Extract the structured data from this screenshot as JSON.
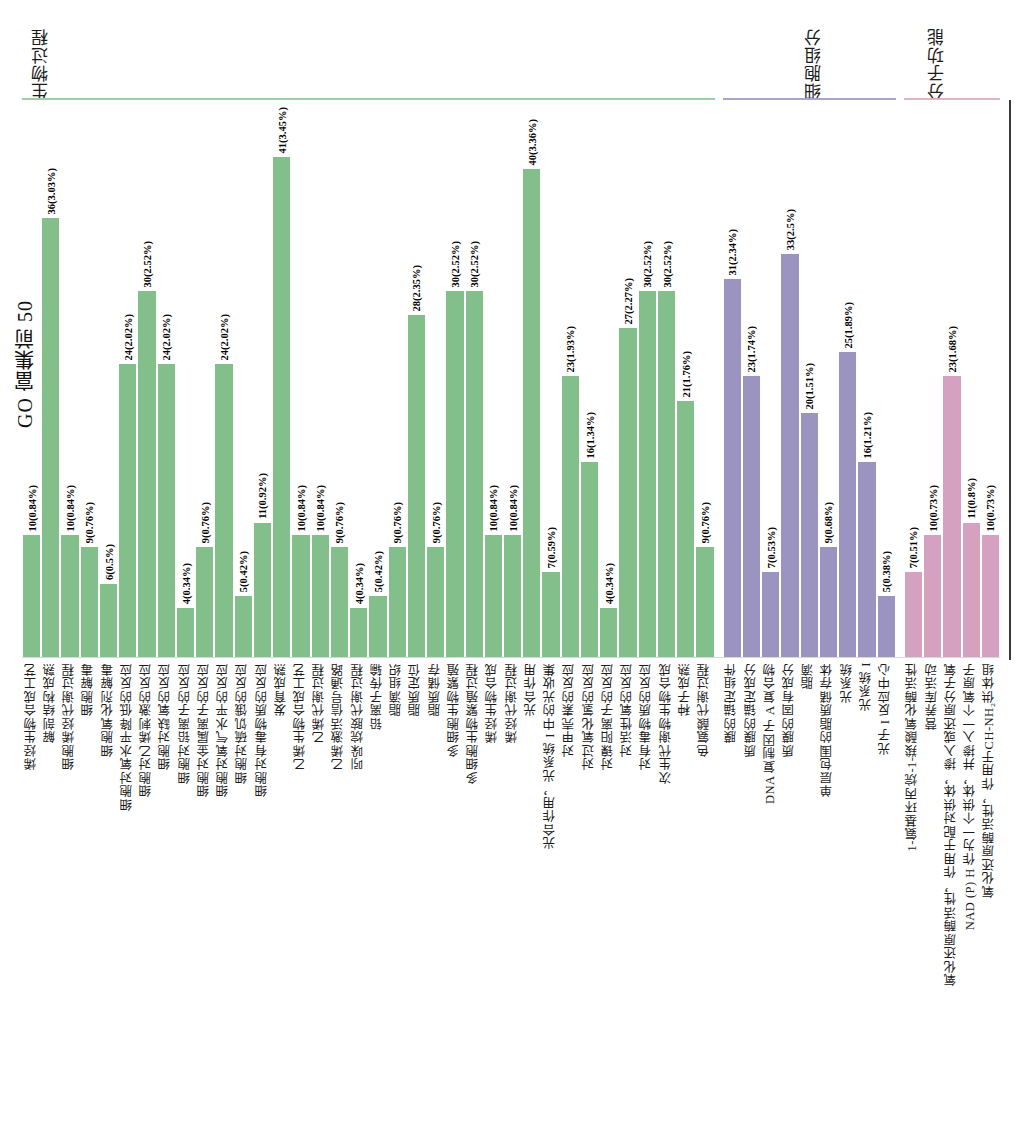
{
  "axis_title": "GO 富集前 50",
  "groups": [
    {
      "name": "生物过程",
      "color": "#82bf8a",
      "rule_color": "#9ccfa4"
    },
    {
      "name": "细胞组分",
      "color": "#9b93c0",
      "rule_color": "#a9a3c9"
    },
    {
      "name": "分子功能",
      "color": "#d4a2c0",
      "rule_color": "#dfb2cc"
    }
  ],
  "chart_data": {
    "type": "bar",
    "title": "GO 富集前 50",
    "xlabel": "",
    "ylabel": "GO 富集前 50",
    "ylim": [
      0,
      45
    ],
    "grid": false,
    "legend_position": "top",
    "group_headers": [
      "生物过程",
      "细胞组分",
      "分子功能"
    ],
    "series": [
      {
        "name": "生物过程",
        "color": "#82bf8a",
        "categories": [
          "烯烃生物合成工艺",
          "解剖结构成熟",
          "细胞烯烃代谢过程",
          "细胞解毒",
          "细胞氧化剂解毒",
          "细胞对氧水平降低的反应",
          "细胞对乙烯刺激的反应",
          "细胞对缺氧的反应",
          "细胞对铅离子的反应",
          "细胞对金属离子的反应",
          "细胞对氧气水平的反应",
          "细胞对硫饥饿的反应",
          "细胞对有毒物质的反应",
          "发育成熟",
          "乙烯生物合成工艺",
          "乙烯代谢过程",
          "乙烯激活信号通路",
          "吲哚烷胺代谢过程",
          "铅离子传输",
          "脂滴组织",
          "脂质定位",
          "脂质储存",
          "多细胞生物繁殖",
          "多细胞生物繁殖过程",
          "烯烃生物合成",
          "烯烃代谢过程",
          "光合作用",
          "光合作用，光系统 I 中的光收集",
          "对甲壳素的反应",
          "对过氧化氢的反应",
          "对镍阳离子的反应",
          "对活性氧的反应",
          "对有毒物质的反应",
          "次生代谢物生物合成",
          "种子成熟",
          "色氨酸代谢过程"
        ],
        "values": [
          10,
          36,
          10,
          9,
          6,
          24,
          30,
          24,
          4,
          9,
          24,
          5,
          11,
          41,
          10,
          10,
          9,
          4,
          5,
          9,
          28,
          9,
          30,
          30,
          10,
          10,
          40,
          7,
          23,
          16,
          4,
          27,
          30,
          30,
          21,
          9
        ],
        "labels": [
          "10(0.84%)",
          "36(3.03%)",
          "10(0.84%)",
          "9(0.76%)",
          "6(0.5%)",
          "24(2.02%)",
          "30(2.52%)",
          "24(2.02%)",
          "4(0.34%)",
          "9(0.76%)",
          "24(2.02%)",
          "5(0.42%)",
          "11(0.92%)",
          "41(3.45%)",
          "10(0.84%)",
          "10(0.84%)",
          "9(0.76%)",
          "4(0.34%)",
          "5(0.42%)",
          "9(0.76%)",
          "28(2.35%)",
          "9(0.76%)",
          "30(2.52%)",
          "30(2.52%)",
          "10(0.84%)",
          "10(0.84%)",
          "40(3.36%)",
          "7(0.59%)",
          "23(1.93%)",
          "16(1.34%)",
          "4(0.34%)",
          "27(2.27%)",
          "30(2.52%)",
          "30(2.52%)",
          "21(1.76%)",
          "9(0.76%)"
        ]
      },
      {
        "name": "细胞组分",
        "color": "#9b93c0",
        "categories": [
          "膜的锚定组件",
          "质膜的锚定成分",
          "DNA 复制因子 A 复合物",
          "质膜的固有成分",
          "脂滴",
          "单层包围的脂质储存体",
          "光系统",
          "光系统 I",
          "光子 I 反应中心"
        ],
        "values": [
          31,
          23,
          7,
          33,
          20,
          9,
          25,
          16,
          5
        ],
        "labels": [
          "31(2.34%)",
          "23(1.74%)",
          "7(0.53%)",
          "33(2.5%)",
          "20(1.51%)",
          "9(0.68%)",
          "25(1.89%)",
          "16(1.21%)",
          "5(0.38%)"
        ]
      },
      {
        "name": "分子功能",
        "color": "#d4a2c0",
        "categories": [
          "1-氨基环丙烷-1-羧酸氧化酶活性",
          "营养库活动",
          "氧化还原酶活性，作用于配对供体，掺入或还原分子氧",
          "NAD (P) H 作为一个供体，并掺入一个氧原子",
          "氧化还原酶活性，作用于CH-NH₂供体组",
          "氧化还原酶活性，作用于CH-NH₂供体组，氧作为受体"
        ],
        "values": [
          7,
          10,
          23,
          11,
          10
        ],
        "labels": [
          "7(0.51%)",
          "10(0.73%)",
          "23(1.68%)",
          "11(0.8%)",
          "10(0.73%)"
        ]
      }
    ]
  },
  "category_labels": [
    "烯烃生物合成工艺",
    "解剖结构成熟",
    "细胞烯烃代谢过程",
    "细胞解毒",
    "细胞氧化剂解毒",
    "细胞对氧水平降低的反应",
    "细胞对乙烯刺激的反应",
    "细胞对缺氧的反应",
    "细胞对铅离子的反应",
    "细胞对金属离子的反应",
    "细胞对氧气水平的反应",
    "细胞对硫饥饿的反应",
    "细胞对有毒物质的反应",
    "发育成熟",
    "乙烯生物合成工艺",
    "乙烯代谢过程",
    "乙烯激活信号通路",
    "吲哚烷胺代谢过程",
    "铅离子传输",
    "脂滴组织",
    "脂质定位",
    "脂质储存",
    "多细胞生物繁殖",
    "多细胞生物繁殖过程",
    "烯烃生物合成",
    "烯烃代谢过程",
    "光合作用",
    "光合作用，光系统 I 中的光收集",
    "对甲壳素的反应",
    "对过氧化氢的反应",
    "对镍阳离子的反应",
    "对活性氧的反应",
    "对有毒物质的反应",
    "次生代谢物生物合成",
    "种子成熟",
    "色氨酸代谢过程",
    "膜的锚定组件",
    "质膜的锚定成分",
    "DNA 复制因子 A 复合物",
    "质膜的固有成分",
    "脂滴",
    "单层包围的脂质储存体",
    "光系统",
    "光系统 I",
    "光子 I 反应中心",
    "1-氨基环丙烷-1-羧酸氧化酶活性",
    "营养库活动",
    "氧化还原酶活性，作用于配对供体，掺入或还原分子氧",
    "NAD (P) H 作为一个供体，并掺入一个氧原子",
    "氧化还原酶活性，作用于CH-NH₂供体组",
    "氧化还原酶活性，作用于CH-NH₂供体组，氧作为受体"
  ]
}
